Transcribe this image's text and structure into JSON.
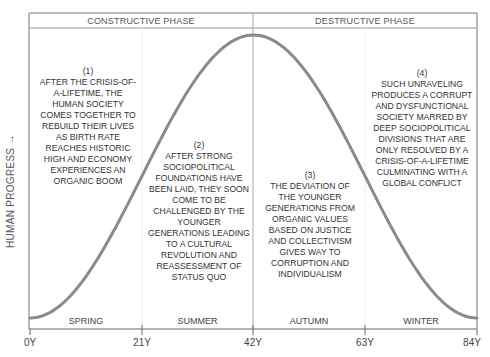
{
  "diagram": {
    "phases": [
      {
        "label": "CONSTRUCTIVE PHASE"
      },
      {
        "label": "DESTRUCTIVE PHASE"
      }
    ],
    "y_axis_label": "HUMAN PROGRESS →",
    "x_ticks": [
      "0Y",
      "21Y",
      "42Y",
      "63Y",
      "84Y"
    ],
    "seasons": [
      "SPRING",
      "SUMMER",
      "AUTUMN",
      "WINTER"
    ],
    "notes": [
      {
        "number": "(1)",
        "lines": [
          "AFTER THE CRISIS-OF-",
          "A-LIFETIME, THE",
          "HUMAN SOCIETY",
          "COMES TOGETHER TO",
          "REBUILD THEIR LIVES",
          "AS BIRTH RATE",
          "REACHES HISTORIC",
          "HIGH AND ECONOMY",
          "EXPERIENCES AN",
          "ORGANIC BOOM"
        ]
      },
      {
        "number": "(2)",
        "lines": [
          "AFTER STRONG",
          "SOCIOPOLITICAL",
          "FOUNDATIONS HAVE",
          "BEEN LAID, THEY SOON",
          "COME TO BE",
          "CHALLENGED BY THE",
          "YOUNGER",
          "GENERATIONS LEADING",
          "TO A CULTURAL",
          "REVOLUTION AND",
          "REASSESSMENT OF",
          "STATUS QUO"
        ]
      },
      {
        "number": "(3)",
        "lines": [
          "THE DEVIATION OF",
          "THE YOUNGER",
          "GENERATIONS FROM",
          "ORGANIC VALUES",
          "BASED ON JUSTICE",
          "AND COLLECTIVISM",
          "GIVES WAY TO",
          "CORRUPTION AND",
          "INDIVIDUALISM"
        ]
      },
      {
        "number": "(4)",
        "lines": [
          "SUCH UNRAVELING",
          "PRODUCES A CORRUPT",
          "AND DYSFUNCTIONAL",
          "SOCIETY MARRED BY",
          "DEEP SOCIOPOLITICAL",
          "DIVISIONS THAT ARE",
          "ONLY RESOLVED BY A",
          "CRISIS-OF-A-LIFETIME",
          "CULMINATING WITH A",
          "GLOBAL CONFLICT"
        ]
      }
    ],
    "colors": {
      "curve": "#8a8a8a",
      "frame": "#777777",
      "divider": "#e4e4e4",
      "text": "#333333"
    }
  }
}
